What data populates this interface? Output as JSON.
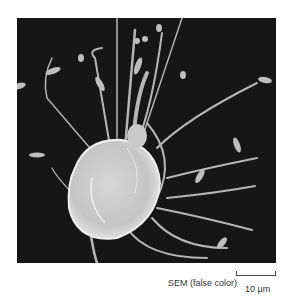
{
  "figure": {
    "caption": "SEM (false color)",
    "scale_bar_label": "10 µm",
    "colors": {
      "background": "#161616",
      "specimen": "#c8c8c8"
    }
  }
}
